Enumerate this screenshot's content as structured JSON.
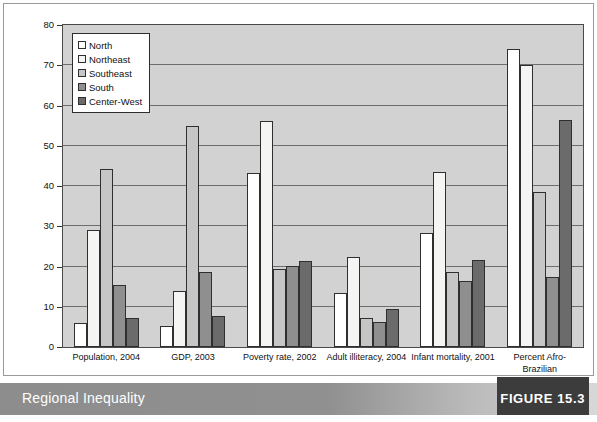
{
  "caption": {
    "title": "Regional Inequality",
    "figure_label": "FIGURE 15.3"
  },
  "chart_data": {
    "type": "bar",
    "title": "",
    "xlabel": "",
    "ylabel": "",
    "ylim": [
      0,
      80
    ],
    "yticks": [
      0,
      10,
      20,
      30,
      40,
      50,
      60,
      70,
      80
    ],
    "grid": true,
    "legend_position": "top-left",
    "categories": [
      "Population, 2004",
      "GDP, 2003",
      "Poverty rate, 2002",
      "Adult illiteracy, 2004",
      "Infant mortality, 2001",
      "Percent Afro-Brazilian"
    ],
    "series": [
      {
        "name": "North",
        "color": "#ffffff",
        "values": [
          6.0,
          5.2,
          43.3,
          13.4,
          28.4,
          74.0
        ]
      },
      {
        "name": "Northeast",
        "color": "#f5f5f3",
        "values": [
          29.0,
          14.0,
          56.2,
          22.4,
          43.5,
          70.0
        ]
      },
      {
        "name": "Southeast",
        "color": "#c6c6c6",
        "values": [
          44.2,
          55.0,
          19.5,
          7.3,
          18.7,
          38.4
        ]
      },
      {
        "name": "South",
        "color": "#8f8f8f",
        "values": [
          15.3,
          18.7,
          20.2,
          6.3,
          16.5,
          17.3
        ]
      },
      {
        "name": "Center-West",
        "color": "#6b6b6b",
        "values": [
          7.3,
          7.8,
          21.4,
          9.4,
          21.5,
          56.3
        ]
      }
    ]
  }
}
